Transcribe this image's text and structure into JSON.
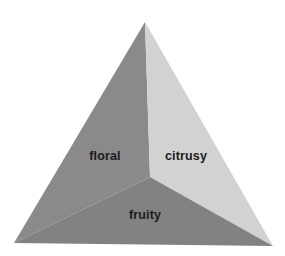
{
  "figure": {
    "name": "aroma-pyramid",
    "background_color": "#ffffff",
    "shape": "triangular-pyramid",
    "geometry": {
      "apex": [
        145,
        22
      ],
      "bottom_left": [
        14,
        243
      ],
      "bottom_right": [
        273,
        246
      ],
      "center_vertex": [
        150,
        177
      ]
    },
    "faces": [
      {
        "id": "left",
        "label": "floral",
        "color": "#8a8a8a",
        "label_x": 105,
        "label_y": 157,
        "points": "145,22 14,243 150,177"
      },
      {
        "id": "right",
        "label": "citrusy",
        "color": "#d2d2d2",
        "label_x": 186,
        "label_y": 157,
        "points": "145,22 150,177 273,246"
      },
      {
        "id": "bottom",
        "label": "fruity",
        "color": "#828282",
        "label_x": 145,
        "label_y": 216,
        "points": "14,243 150,177 273,246"
      }
    ],
    "label_color": "#1c1c1c"
  }
}
